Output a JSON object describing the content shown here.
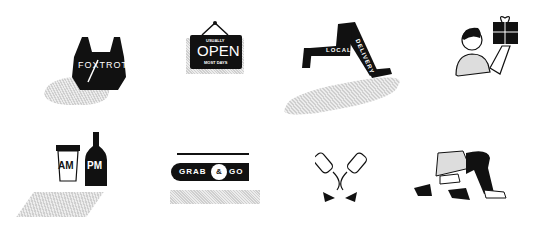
{
  "icons": [
    {
      "name": "foxtrot-bag",
      "text": "FOXTROT"
    },
    {
      "name": "open-sign",
      "top": "USUALLY",
      "main": "OPEN",
      "bottom": "MOST DAYS"
    },
    {
      "name": "local-delivery-legs",
      "text1": "LOCAL",
      "text2": "DELIVERY"
    },
    {
      "name": "person-with-gift"
    },
    {
      "name": "am-pm-drinks",
      "cup": "AM",
      "bottle": "PM"
    },
    {
      "name": "grab-and-go-sign",
      "left": "GRAB",
      "amp": "&",
      "right": "GO"
    },
    {
      "name": "wine-bottles-glasses"
    },
    {
      "name": "legs-heels-sneakers"
    }
  ]
}
